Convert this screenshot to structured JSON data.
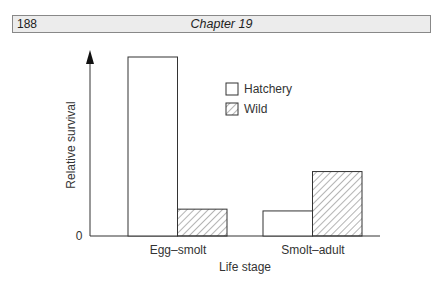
{
  "header": {
    "page_number": "188",
    "chapter_title": "Chapter 19"
  },
  "legend": {
    "items": [
      {
        "label": "Hatchery",
        "pattern": "open"
      },
      {
        "label": "Wild",
        "pattern": "hatched"
      }
    ]
  },
  "axes": {
    "ylabel": "Relative survival",
    "xlabel": "Life stage",
    "y_zero_label": "0"
  },
  "chart_data": {
    "type": "bar",
    "title": "",
    "xlabel": "Life stage",
    "ylabel": "Relative survival",
    "categories": [
      "Egg–smolt",
      "Smolt–adult"
    ],
    "series": [
      {
        "name": "Hatchery",
        "values": [
          1.0,
          0.14
        ]
      },
      {
        "name": "Wild",
        "values": [
          0.15,
          0.36
        ]
      }
    ],
    "ylim": [
      0,
      1.0
    ],
    "y_ticks": [
      "0"
    ],
    "grid": false,
    "legend_position": "upper right (inside)"
  }
}
